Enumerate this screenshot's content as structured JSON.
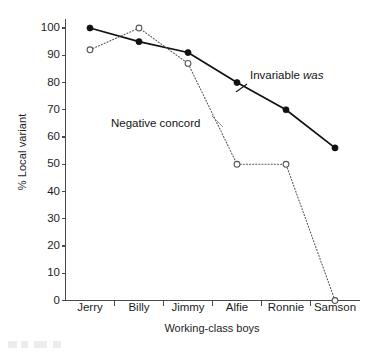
{
  "chart_data": {
    "type": "line",
    "title": "",
    "xlabel": "Working-class boys",
    "ylabel": "% Local variant",
    "categories": [
      "Jerry",
      "Billy",
      "Jimmy",
      "Alfie",
      "Ronnie",
      "Samson"
    ],
    "ylim": [
      0,
      100
    ],
    "yticks": [
      0,
      10,
      20,
      30,
      40,
      50,
      60,
      70,
      80,
      90,
      100
    ],
    "grid": false,
    "legend": "inline annotations",
    "series": [
      {
        "name": "Invariable was",
        "values": [
          100,
          95,
          91,
          80,
          70,
          56
        ],
        "line_style": "solid",
        "marker": "filled-circle",
        "color": "#111111"
      },
      {
        "name": "Negative concord",
        "values": [
          92,
          100,
          87,
          50,
          50,
          0
        ],
        "line_style": "dotted",
        "marker": "open-circle",
        "color": "#555555"
      }
    ],
    "annotations": [
      {
        "id": "invariable",
        "text_before": "Invariable ",
        "text_italic": "was",
        "series": "Invariable was"
      },
      {
        "id": "negative",
        "text_before": "Negative concord",
        "text_italic": "",
        "series": "Negative concord"
      }
    ],
    "axis_color": "#4a4a4a"
  },
  "yticks_labels": [
    "100",
    "90",
    "80",
    "70",
    "60",
    "50",
    "40",
    "30",
    "20",
    "10",
    "0"
  ],
  "xticks_labels": [
    "Jerry",
    "Billy",
    "Jimmy",
    "Alfie",
    "Ronnie",
    "Samson"
  ],
  "axis": {
    "ylabel": "% Local variant",
    "xlabel": "Working-class boys"
  },
  "annotations": {
    "invariable_prefix": "Invariable ",
    "invariable_italic": "was",
    "negative": "Negative concord"
  }
}
